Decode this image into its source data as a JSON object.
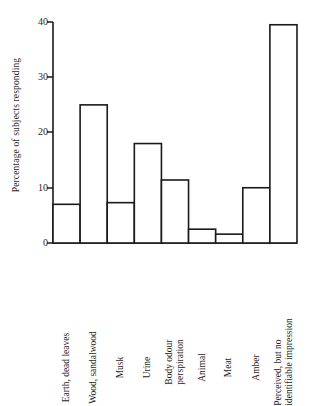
{
  "chart_data": {
    "type": "bar",
    "title": "",
    "subtitle": "",
    "xlabel": "",
    "ylabel": "Percentage of subjects responding",
    "ylim": [
      0,
      40
    ],
    "yticks": [
      0,
      10,
      20,
      30,
      40
    ],
    "ytick_labels": [
      "0",
      "10",
      "20",
      "30",
      "40"
    ],
    "grid": false,
    "legend": null,
    "orientation": "vertical",
    "bar_style": "outline-only",
    "categories": [
      "Earth, dead leaves",
      "Wood, sandalwood",
      "Musk",
      "Urine",
      "Body odour perspiration",
      "Animal",
      "Meat",
      "Amber",
      "Perceived, but no identifiable impression"
    ],
    "category_lines": [
      [
        "Earth, dead leaves"
      ],
      [
        "Wood, sandalwood"
      ],
      [
        "Musk"
      ],
      [
        "Urine"
      ],
      [
        "Body odour",
        "perspiration"
      ],
      [
        "Animal"
      ],
      [
        "Meat"
      ],
      [
        "Amber"
      ],
      [
        "Perceived, but no",
        "identifiable impression"
      ]
    ],
    "values": [
      7,
      25,
      7.3,
      18,
      11.4,
      2.5,
      1.6,
      10,
      39.5
    ],
    "colors": {
      "bar_stroke": "#1a1a1a",
      "bar_fill": "#ffffff",
      "axis": "#1a1a1a",
      "text": "#1f1f1f",
      "background": "#ffffff"
    }
  }
}
